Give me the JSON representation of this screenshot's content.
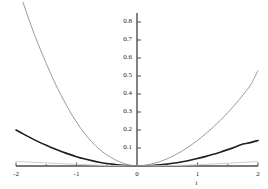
{
  "chart_data": {
    "type": "line",
    "title": "",
    "subtitle": "",
    "xlabel": "t",
    "ylabel": "",
    "xlim": [
      -2,
      2
    ],
    "ylim": [
      0,
      0.85
    ],
    "grid": false,
    "legend": "none",
    "background_color": "#ffffff",
    "axis_color": "#4d4d4d",
    "x_ticks": [
      -2,
      -1,
      0,
      1,
      2
    ],
    "x_tick_labels": [
      "-2",
      "-1",
      "0",
      "1",
      "2"
    ],
    "x_minor_ticks": [
      -1.5,
      -0.5,
      0.5,
      1.5
    ],
    "y_ticks": [
      0.1,
      0.2,
      0.3,
      0.4,
      0.5,
      0.6,
      0.7,
      0.8
    ],
    "y_tick_labels": [
      "0.1",
      "0.2",
      "0.3",
      "0.4",
      "0.5",
      "0.6",
      "0.7",
      "0.8"
    ],
    "series": [
      {
        "name": "steep-curve",
        "color": "#9a9a9a",
        "width": 1.0,
        "x": [
          -2,
          -1.875,
          -1.75,
          -1.625,
          -1.5,
          -1.375,
          -1.25,
          -1.125,
          -1,
          -0.875,
          -0.75,
          -0.625,
          -0.5,
          -0.375,
          -0.25,
          -0.125,
          0,
          0.125,
          0.25,
          0.375,
          0.5,
          0.625,
          0.75,
          0.875,
          1,
          1.125,
          1.25,
          1.375,
          1.5,
          1.625,
          1.75,
          1.875,
          2
        ],
        "values": [
          1.02,
          0.9,
          0.78,
          0.67,
          0.57,
          0.475,
          0.39,
          0.312,
          0.244,
          0.185,
          0.135,
          0.094,
          0.062,
          0.037,
          0.018,
          0.006,
          0.0,
          0.004,
          0.012,
          0.024,
          0.04,
          0.06,
          0.084,
          0.112,
          0.142,
          0.176,
          0.213,
          0.253,
          0.296,
          0.343,
          0.394,
          0.45,
          0.53
        ]
      },
      {
        "name": "bold-curve",
        "color": "#1f1f1f",
        "width": 1.6,
        "x": [
          -2,
          -1.875,
          -1.75,
          -1.625,
          -1.5,
          -1.375,
          -1.25,
          -1.125,
          -1,
          -0.875,
          -0.75,
          -0.625,
          -0.5,
          -0.375,
          -0.25,
          -0.125,
          0,
          0.125,
          0.25,
          0.375,
          0.5,
          0.625,
          0.75,
          0.875,
          1,
          1.125,
          1.25,
          1.375,
          1.5,
          1.625,
          1.75,
          1.875,
          2
        ],
        "values": [
          0.2,
          0.177,
          0.155,
          0.134,
          0.115,
          0.097,
          0.081,
          0.066,
          0.052,
          0.04,
          0.03,
          0.021,
          0.014,
          0.009,
          0.004,
          0.001,
          0.0,
          0.001,
          0.003,
          0.006,
          0.011,
          0.017,
          0.024,
          0.032,
          0.042,
          0.052,
          0.064,
          0.077,
          0.091,
          0.106,
          0.122,
          0.13,
          0.142
        ]
      },
      {
        "name": "flat-curve",
        "color": "#cccccc",
        "width": 1.0,
        "x": [
          -2,
          -1.75,
          -1.5,
          -1.25,
          -1,
          -0.75,
          -0.5,
          -0.25,
          0,
          0.25,
          0.5,
          0.75,
          1,
          1.25,
          1.5,
          1.75,
          2
        ],
        "values": [
          0.026,
          0.021,
          0.017,
          0.013,
          0.009,
          0.006,
          0.003,
          0.001,
          0.0,
          0.001,
          0.002,
          0.004,
          0.007,
          0.011,
          0.015,
          0.02,
          0.025
        ]
      }
    ]
  }
}
